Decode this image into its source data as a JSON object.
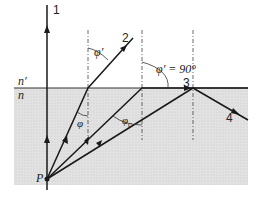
{
  "diagram": {
    "media": {
      "upper": "n′",
      "lower": "n"
    },
    "point_source": "P",
    "rays": [
      {
        "id": "1",
        "label": "1"
      },
      {
        "id": "2",
        "label": "2"
      },
      {
        "id": "3",
        "label": "3"
      },
      {
        "id": "4",
        "label": "4"
      }
    ],
    "angles": {
      "phi_prime": "φ′",
      "phi": "φ",
      "phi_c": "φ",
      "phi_c_sub": "c",
      "phi_prime_90": "φ′ = 90°"
    },
    "colors": {
      "lower_medium": "#dcdcdc",
      "line": "#222222",
      "background": "#ffffff"
    }
  }
}
